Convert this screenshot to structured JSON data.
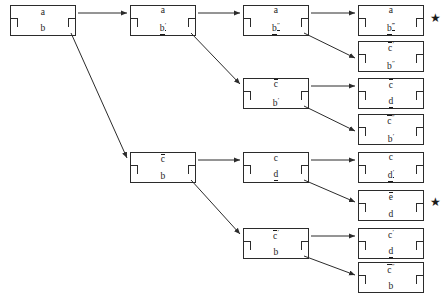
{
  "diagram": {
    "stroke_color": "#2b2b2b",
    "text_color": "#1b1b1b",
    "background": "#ffffff",
    "marker": "★",
    "nodes": [
      {
        "id": "n1",
        "x": 10,
        "y": 5,
        "top": "a",
        "top_over": false,
        "top_primes": 0,
        "bottom": "b",
        "bottom_under": false,
        "bottom_primes": 0,
        "star": false
      },
      {
        "id": "n2",
        "x": 130,
        "y": 5,
        "top": "a",
        "top_over": false,
        "top_primes": 0,
        "bottom": "b",
        "bottom_under": true,
        "bottom_primes": 1,
        "star": false
      },
      {
        "id": "n3",
        "x": 243,
        "y": 5,
        "top": "a",
        "top_over": false,
        "top_primes": 0,
        "bottom": "b",
        "bottom_under": true,
        "bottom_primes": 2,
        "star": false
      },
      {
        "id": "n4",
        "x": 358,
        "y": 5,
        "top": "a",
        "top_over": false,
        "top_primes": 0,
        "bottom": "b",
        "bottom_under": true,
        "bottom_primes": 3,
        "star": true
      },
      {
        "id": "n5",
        "x": 358,
        "y": 41,
        "top": "c",
        "top_over": true,
        "top_primes": 1,
        "bottom": "b",
        "bottom_under": false,
        "bottom_primes": 2,
        "star": false
      },
      {
        "id": "n6",
        "x": 243,
        "y": 78,
        "top": "c",
        "top_over": true,
        "top_primes": 0,
        "bottom": "b",
        "bottom_under": false,
        "bottom_primes": 1,
        "star": false
      },
      {
        "id": "n7",
        "x": 358,
        "y": 78,
        "top": "c",
        "top_over": true,
        "top_primes": 0,
        "bottom": "d",
        "bottom_under": true,
        "bottom_primes": 0,
        "star": false
      },
      {
        "id": "n8",
        "x": 358,
        "y": 114,
        "top": "c",
        "top_over": true,
        "top_primes": 2,
        "bottom": "b",
        "bottom_under": false,
        "bottom_primes": 1,
        "star": false
      },
      {
        "id": "n9",
        "x": 130,
        "y": 152,
        "top": "c",
        "top_over": true,
        "top_primes": 0,
        "bottom": "b",
        "bottom_under": false,
        "bottom_primes": 0,
        "star": false
      },
      {
        "id": "n10",
        "x": 243,
        "y": 152,
        "top": "c",
        "top_over": false,
        "top_primes": 0,
        "bottom": "d",
        "bottom_under": true,
        "bottom_primes": 0,
        "star": false
      },
      {
        "id": "n11",
        "x": 358,
        "y": 152,
        "top": "c",
        "top_over": false,
        "top_primes": 0,
        "bottom": "d",
        "bottom_under": true,
        "bottom_primes": 1,
        "star": false
      },
      {
        "id": "n12",
        "x": 358,
        "y": 190,
        "top": "e",
        "top_over": true,
        "top_primes": 0,
        "bottom": "d",
        "bottom_under": false,
        "bottom_primes": 0,
        "star": true
      },
      {
        "id": "n13",
        "x": 243,
        "y": 228,
        "top": "c",
        "top_over": true,
        "top_primes": 1,
        "bottom": "b",
        "bottom_under": false,
        "bottom_primes": 0,
        "star": false
      },
      {
        "id": "n14",
        "x": 358,
        "y": 228,
        "top": "c",
        "top_over": false,
        "top_primes": 1,
        "bottom": "d",
        "bottom_under": true,
        "bottom_primes": 0,
        "star": false
      },
      {
        "id": "n15",
        "x": 358,
        "y": 262,
        "top": "c",
        "top_over": true,
        "top_primes": 2,
        "bottom": "b",
        "bottom_under": false,
        "bottom_primes": 0,
        "star": false
      }
    ],
    "edges": [
      {
        "id": "e1",
        "from": "n1",
        "to": "n2",
        "x1": 78,
        "y1": 13,
        "x2": 127,
        "y2": 13,
        "arrow": true
      },
      {
        "id": "e2",
        "from": "n2",
        "to": "n3",
        "x1": 198,
        "y1": 13,
        "x2": 240,
        "y2": 13,
        "arrow": true
      },
      {
        "id": "e3",
        "from": "n3",
        "to": "n4",
        "x1": 311,
        "y1": 13,
        "x2": 355,
        "y2": 13,
        "arrow": true
      },
      {
        "id": "e4",
        "from": "n3",
        "to": "n5",
        "x1": 304,
        "y1": 33,
        "x2": 355,
        "y2": 58,
        "arrow": true
      },
      {
        "id": "e5",
        "from": "n2",
        "to": "n6",
        "x1": 191,
        "y1": 33,
        "x2": 240,
        "y2": 84,
        "arrow": true
      },
      {
        "id": "e6",
        "from": "n6",
        "to": "n7",
        "x1": 311,
        "y1": 86,
        "x2": 355,
        "y2": 86,
        "arrow": true
      },
      {
        "id": "e7",
        "from": "n6",
        "to": "n8",
        "x1": 304,
        "y1": 106,
        "x2": 355,
        "y2": 131,
        "arrow": true
      },
      {
        "id": "e8",
        "from": "n1",
        "to": "n9",
        "x1": 71,
        "y1": 33,
        "x2": 127,
        "y2": 158,
        "arrow": true
      },
      {
        "id": "e9",
        "from": "n9",
        "to": "n10",
        "x1": 198,
        "y1": 160,
        "x2": 240,
        "y2": 160,
        "arrow": true
      },
      {
        "id": "e10",
        "from": "n10",
        "to": "n11",
        "x1": 311,
        "y1": 160,
        "x2": 355,
        "y2": 160,
        "arrow": true
      },
      {
        "id": "e11",
        "from": "n10",
        "to": "n12",
        "x1": 304,
        "y1": 180,
        "x2": 355,
        "y2": 202,
        "arrow": true
      },
      {
        "id": "e12",
        "from": "n9",
        "to": "n13",
        "x1": 191,
        "y1": 180,
        "x2": 240,
        "y2": 234,
        "arrow": true
      },
      {
        "id": "e13",
        "from": "n13",
        "to": "n14",
        "x1": 311,
        "y1": 236,
        "x2": 355,
        "y2": 236,
        "arrow": true
      },
      {
        "id": "e14",
        "from": "n13",
        "to": "n15",
        "x1": 304,
        "y1": 256,
        "x2": 355,
        "y2": 275,
        "arrow": true
      }
    ],
    "stars": [
      {
        "id": "s1",
        "x": 430,
        "y": 12,
        "label": "★"
      },
      {
        "id": "s2",
        "x": 430,
        "y": 196,
        "label": "★"
      }
    ]
  }
}
